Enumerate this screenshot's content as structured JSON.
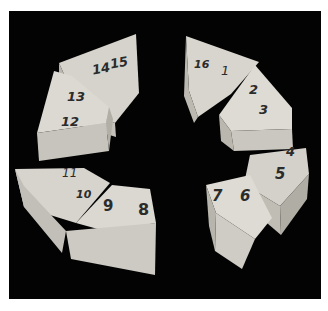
{
  "photo": {
    "description": "Eight wedge-shaped light wooden blocks arranged in a ring on a black background, each top face hand-labeled with numbers",
    "background_color": "#030303",
    "wood_top_color": "#d9d6cf",
    "wood_side_color": "#bdbab2",
    "blocks": [
      {
        "id": "block-14-15",
        "labels": [
          "14",
          "15"
        ]
      },
      {
        "id": "block-12-13",
        "labels": [
          "13",
          "12"
        ]
      },
      {
        "id": "block-16-1",
        "labels": [
          "16",
          "1"
        ]
      },
      {
        "id": "block-2-3",
        "labels": [
          "2",
          "3"
        ]
      },
      {
        "id": "block-4-5",
        "labels": [
          "4",
          "5"
        ]
      },
      {
        "id": "block-6-7",
        "labels": [
          "7",
          "6"
        ]
      },
      {
        "id": "block-8-9",
        "labels": [
          "9",
          "8"
        ]
      },
      {
        "id": "block-10-11",
        "labels": [
          "11",
          "10"
        ]
      }
    ]
  }
}
